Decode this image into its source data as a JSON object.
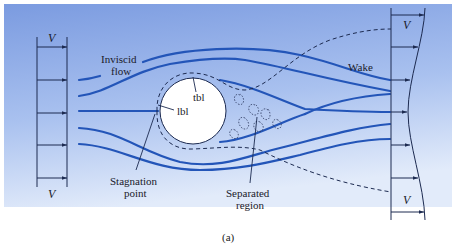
{
  "figure": {
    "caption": "(a)",
    "colors": {
      "background_top": "#7b9be0",
      "background_bottom": "#e2ebfa",
      "streamline": "#2355b8",
      "body_fill": "#ffffff",
      "line": "#1c2a50"
    },
    "upstream_profile": {
      "label_top": "V",
      "label_bottom": "V",
      "arrow_count": 5
    },
    "downstream_profile": {
      "label_top": "V",
      "label_bottom": "V",
      "arrow_count": 7
    },
    "labels": {
      "inviscid_line1": "Inviscid",
      "inviscid_line2": "flow",
      "wake": "Wake",
      "tbl": "tbl",
      "lbl": "lbl",
      "stagnation_line1": "Stagnation",
      "stagnation_line2": "point",
      "separated_line1": "Separated",
      "separated_line2": "region"
    }
  }
}
